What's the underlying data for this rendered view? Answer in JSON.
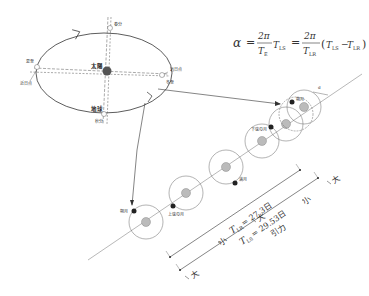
{
  "orbit": {
    "sun_label": "太陽",
    "earth_label": "地球",
    "points": {
      "top": "春分",
      "left_top": "夏至",
      "left_bottom": "近日点",
      "right_top": "远日点",
      "right_bottom": "冬至",
      "bottom": "秋分"
    }
  },
  "formula": {
    "alpha": "α",
    "eq": "=",
    "two_pi": "2π",
    "T_E": "T",
    "T_E_sub": "E",
    "T_LS": "T",
    "T_LS_sub": "LS",
    "T_LR": "T",
    "T_LR_sub": "LR",
    "minus": "−",
    "lparen": "(",
    "rparen": ")"
  },
  "moon_phases": {
    "new_moon": "朔月",
    "first_quarter": "上弦の月",
    "full_moon": "满月",
    "last_quarter": "下弦の月",
    "new_moon2": "朔月",
    "delta_label": "d"
  },
  "periods": {
    "sidereal": "T_LR = 27.3日",
    "sidereal_T": "T",
    "sidereal_sub": "LR",
    "sidereal_val": "= 27.3日",
    "synodic_T": "T",
    "synodic_sub": "LS",
    "synodic_val": "= 29.53日"
  },
  "force": {
    "large": "大",
    "small": "小",
    "label": "引力"
  }
}
